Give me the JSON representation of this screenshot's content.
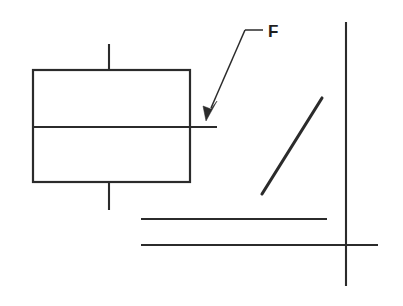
{
  "diagram": {
    "background_color": "#ffffff",
    "stroke_color": "#2b2b2b",
    "width": 403,
    "height": 306,
    "labels": [
      {
        "id": "force-label",
        "text": "F",
        "x": 268,
        "y": 37,
        "meaning": "force"
      }
    ],
    "shapes": {
      "block": {
        "name": "rectangle-block",
        "x": 33,
        "y": 70,
        "width": 157,
        "height": 112,
        "divider_y": 127
      },
      "stub_top": {
        "x": 109,
        "y1": 44,
        "y2": 70
      },
      "stub_bottom": {
        "x": 109,
        "y1": 182,
        "y2": 210
      },
      "midline_extension": {
        "x1": 33,
        "x2": 217,
        "y": 127
      },
      "diagonal_segment": {
        "x1": 262,
        "y1": 194,
        "x2": 322,
        "y2": 98
      },
      "baseline_upper": {
        "x1": 141,
        "x2": 327,
        "y": 219
      },
      "baseline_lower": {
        "x1": 141,
        "x2": 378,
        "y": 245
      },
      "vertical_axis": {
        "x": 346,
        "y1": 22,
        "y2": 286
      },
      "leader": {
        "horizontal": {
          "x1": 245,
          "x2": 263,
          "y": 30
        },
        "diagonal": {
          "x1": 245,
          "y1": 30,
          "x2": 210,
          "y2": 110
        },
        "arrow_tip": {
          "x": 206,
          "y": 121
        }
      }
    }
  }
}
